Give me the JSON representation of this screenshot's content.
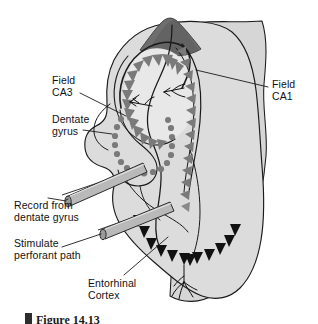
{
  "figure": {
    "caption": "Figure 14.13",
    "caption_bullet": "square-bullet"
  },
  "labels": {
    "field_ca3": "Field\nCA3",
    "dentate_gyrus": "Dentate\ngyrus",
    "record_from_dentate_gyrus": "Record from\ndentate gyrus",
    "stimulate_perforant_path": "Stimulate\nperforant path",
    "entorhinal_cortex": "Entorhinal\nCortex",
    "field_ca1": "Field\nCA1"
  },
  "colors": {
    "tissue_fill": "#dcdcdc",
    "tissue_fill_light": "#e4e4e4",
    "cortex_band": "#d6d6d6",
    "dark_cap": "#6e6e6e",
    "outline": "#1a1a1a",
    "gray_cell": "#7a7a7a",
    "black_cell": "#111111",
    "electrode_body": "#b9b9b9",
    "electrode_tip": "#9a9a9a",
    "leader_line": "#1a1a1a",
    "text": "#121212",
    "background": "#ffffff"
  },
  "structures": [
    {
      "name": "field-ca3",
      "cell_type": "pyramidal-triangle",
      "cell_color": "#7a7a7a",
      "cell_count": 17
    },
    {
      "name": "field-ca1",
      "cell_type": "pyramidal-triangle",
      "cell_color": "#7a7a7a",
      "cell_count": 14
    },
    {
      "name": "dentate-gyrus",
      "cell_type": "granule-dot",
      "cell_color": "#7a7a7a",
      "cell_count": 19
    },
    {
      "name": "entorhinal-cortex",
      "cell_type": "pyramidal-triangle",
      "cell_color": "#111111",
      "cell_count": 13
    },
    {
      "name": "subiculum-cap",
      "cell_type": "shaded-region",
      "cell_color": "#6e6e6e",
      "cell_count": 0
    }
  ],
  "electrodes": [
    {
      "name": "recording-electrode",
      "target": "dentate-gyrus",
      "label_key": "record_from_dentate_gyrus"
    },
    {
      "name": "stimulating-electrode",
      "target": "perforant-path",
      "label_key": "stimulate_perforant_path"
    }
  ]
}
